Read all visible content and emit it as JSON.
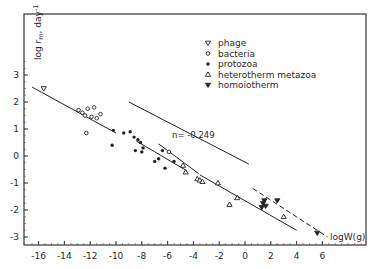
{
  "chart_data": {
    "type": "scatter",
    "title": "",
    "xlabel": "logW(g)",
    "ylabel": "log r_m, day^-1",
    "xlim": [
      -17,
      8
    ],
    "ylim": [
      -3.3,
      4.8
    ],
    "x_ticks": [
      -16,
      -14,
      -12,
      -10,
      -8,
      -6,
      -4,
      -2,
      0,
      2,
      4,
      6
    ],
    "y_ticks": [
      3,
      2,
      1,
      0,
      -1,
      -2,
      -3
    ],
    "grid": false,
    "legend_position": "upper-center",
    "legend": [
      {
        "label": "phage",
        "marker": "triangle-down-open"
      },
      {
        "label": "bacteria",
        "marker": "circle-open-small"
      },
      {
        "label": "protozoa",
        "marker": "circle-filled"
      },
      {
        "label": "heterotherm metazoa",
        "marker": "triangle-up-open"
      },
      {
        "label": "homoiotherm",
        "marker": "triangle-down-filled"
      }
    ],
    "annotations": [
      {
        "text": "n= -0.249",
        "x": -6.2,
        "y": 0.55
      }
    ],
    "series": [
      {
        "name": "phage",
        "points": [
          [
            -15.6,
            2.5
          ]
        ]
      },
      {
        "name": "bacteria",
        "points": [
          [
            -12.9,
            1.7
          ],
          [
            -12.6,
            1.6
          ],
          [
            -12.4,
            1.5
          ],
          [
            -12.2,
            1.75
          ],
          [
            -11.9,
            1.45
          ],
          [
            -11.7,
            1.8
          ],
          [
            -11.2,
            1.55
          ],
          [
            -11.5,
            1.4
          ],
          [
            -12.3,
            0.85
          ],
          [
            -5.9,
            0.15
          ]
        ]
      },
      {
        "name": "protozoa",
        "points": [
          [
            -10.2,
            0.95
          ],
          [
            -9.4,
            0.85
          ],
          [
            -8.9,
            0.9
          ],
          [
            -8.6,
            0.7
          ],
          [
            -8.3,
            0.6
          ],
          [
            -8.1,
            0.5
          ],
          [
            -10.3,
            0.4
          ],
          [
            -8.5,
            0.2
          ],
          [
            -7.9,
            0.3
          ],
          [
            -8.0,
            0.15
          ],
          [
            -7.0,
            -0.2
          ],
          [
            -6.7,
            -0.1
          ],
          [
            -6.4,
            0.2
          ],
          [
            -6.2,
            -0.45
          ],
          [
            -5.5,
            -0.2
          ]
        ]
      },
      {
        "name": "heterotherm metazoa",
        "points": [
          [
            -4.8,
            -0.35
          ],
          [
            -4.6,
            -0.6
          ],
          [
            -3.7,
            -0.85
          ],
          [
            -3.5,
            -0.9
          ],
          [
            -3.3,
            -0.95
          ],
          [
            -2.1,
            -1.0
          ],
          [
            -0.6,
            -1.55
          ],
          [
            -1.2,
            -1.8
          ],
          [
            3.0,
            -2.25
          ]
        ]
      },
      {
        "name": "homoiotherm",
        "points": [
          [
            1.4,
            -1.75
          ],
          [
            1.5,
            -1.65
          ],
          [
            1.6,
            -1.85
          ],
          [
            2.5,
            -1.65
          ],
          [
            1.3,
            -1.9
          ],
          [
            5.6,
            -2.85
          ]
        ]
      }
    ],
    "fit_lines": [
      {
        "name": "main regression",
        "style": "solid",
        "from": [
          -16.5,
          2.55
        ],
        "to": [
          -10.0,
          0.85
        ]
      },
      {
        "name": "main regression cont.",
        "style": "solid",
        "from": [
          -8.4,
          0.55
        ],
        "to": [
          -4.5,
          -0.55
        ]
      },
      {
        "name": "protozoa upper",
        "style": "solid",
        "from": [
          -6.7,
          0.45
        ],
        "to": [
          -3.6,
          -0.65
        ]
      },
      {
        "name": "metazoa",
        "style": "solid",
        "from": [
          -3.5,
          -0.7
        ],
        "to": [
          4.0,
          -2.75
        ]
      },
      {
        "name": "n=-0.249 reference",
        "style": "solid",
        "from": [
          -9.0,
          2.0
        ],
        "to": [
          0.3,
          -0.3
        ]
      },
      {
        "name": "homoiotherm",
        "style": "dashed",
        "from": [
          0.6,
          -1.2
        ],
        "to": [
          6.4,
          -3.0
        ]
      }
    ]
  }
}
